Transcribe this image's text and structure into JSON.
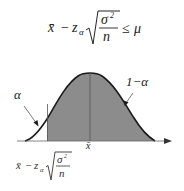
{
  "diagram": {
    "title_formula": {
      "lhs_mean": "x̄",
      "minus": "−",
      "z": "z",
      "z_sub": "α",
      "numerator": "σ",
      "numerator_exp": "2",
      "denominator": "n",
      "relation": "≤",
      "rhs": "μ"
    },
    "labels": {
      "alpha": "α",
      "one_minus_alpha": "1−α",
      "center": "x̄"
    },
    "bound_formula": {
      "mean": "x̄",
      "minus": "−",
      "z": "z",
      "z_sub": "α",
      "numerator": "σ",
      "numerator_exp": "2",
      "denominator": "n"
    },
    "colors": {
      "curve": "#1a1a1a",
      "shaded_region": "#8c8c8c",
      "axis": "#444444"
    }
  }
}
